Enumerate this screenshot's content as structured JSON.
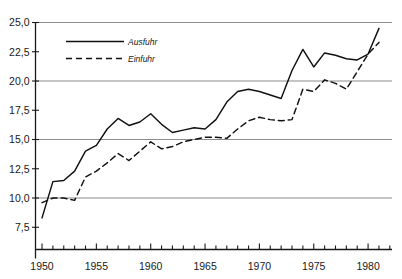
{
  "chart_data": {
    "type": "line",
    "title": "",
    "subtitle": "",
    "xlabel": "",
    "ylabel": "",
    "xlim": [
      1949.4,
      1982.2
    ],
    "ylim": [
      5.6,
      25.0
    ],
    "grid": true,
    "gridlines_y": [
      10.0,
      15.0,
      20.0,
      25.0
    ],
    "legend_position": "upper-left-inside",
    "y_ticks": [
      7.5,
      10.0,
      12.5,
      15.0,
      17.5,
      20.0,
      22.5,
      25.0
    ],
    "y_tick_labels": [
      "7,5",
      "10,0",
      "12,5",
      "15,0",
      "17,5",
      "20,0",
      "22,5",
      "25,0"
    ],
    "x_ticks": [
      1950,
      1951,
      1952,
      1953,
      1954,
      1955,
      1956,
      1957,
      1958,
      1959,
      1960,
      1961,
      1962,
      1963,
      1964,
      1965,
      1966,
      1967,
      1968,
      1969,
      1970,
      1971,
      1972,
      1973,
      1974,
      1975,
      1976,
      1977,
      1978,
      1979,
      1980,
      1981,
      1982
    ],
    "x_tick_labels": [
      {
        "value": 1950,
        "label": "1950"
      },
      {
        "value": 1955,
        "label": "1955"
      },
      {
        "value": 1960,
        "label": "1960"
      },
      {
        "value": 1965,
        "label": "1965"
      },
      {
        "value": 1970,
        "label": "1970"
      },
      {
        "value": 1975,
        "label": "1975"
      },
      {
        "value": 1980,
        "label": "1980"
      }
    ],
    "x": [
      1950,
      1951,
      1952,
      1953,
      1954,
      1955,
      1956,
      1957,
      1958,
      1959,
      1960,
      1961,
      1962,
      1963,
      1964,
      1965,
      1966,
      1967,
      1968,
      1969,
      1970,
      1971,
      1972,
      1973,
      1974,
      1975,
      1976,
      1977,
      1978,
      1979,
      1980,
      1981
    ],
    "series": [
      {
        "name": "Ausfuhr",
        "style": "solid",
        "color": "#111111",
        "values": [
          8.3,
          11.4,
          11.5,
          12.3,
          14.0,
          14.5,
          15.9,
          16.8,
          16.2,
          16.5,
          17.2,
          16.3,
          15.6,
          15.8,
          16.0,
          15.9,
          16.7,
          18.2,
          19.1,
          19.3,
          19.1,
          18.8,
          18.5,
          20.9,
          22.7,
          21.2,
          22.4,
          22.2,
          21.9,
          21.8,
          22.3,
          24.5
        ]
      },
      {
        "name": "Einfuhr",
        "style": "dashed",
        "color": "#111111",
        "values": [
          9.6,
          10.0,
          10.0,
          9.8,
          11.8,
          12.3,
          13.0,
          13.8,
          13.2,
          14.0,
          14.8,
          14.2,
          14.4,
          14.8,
          15.0,
          15.2,
          15.2,
          15.1,
          15.9,
          16.6,
          16.9,
          16.7,
          16.6,
          16.7,
          19.3,
          19.1,
          20.1,
          19.8,
          19.3,
          20.8,
          22.3,
          23.3
        ]
      }
    ]
  },
  "legend": {
    "items": [
      {
        "label": "Ausfuhr",
        "style": "solid"
      },
      {
        "label": "Einfuhr",
        "style": "dashed"
      }
    ]
  }
}
